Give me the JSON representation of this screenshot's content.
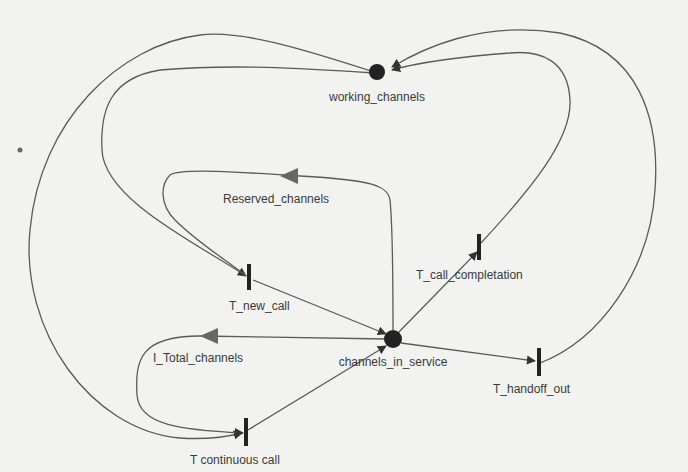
{
  "diagram": {
    "type": "petri-net",
    "colors": {
      "background": "#f2f2f0",
      "arc": "#5a5a5a",
      "place": "#222222",
      "transition": "#222222",
      "inhibitor_arrow": "#666666",
      "label": "#3a3a3a"
    },
    "places": [
      {
        "id": "working_channels",
        "label": "working_channels"
      },
      {
        "id": "channels_in_service",
        "label": "channels_in_service"
      }
    ],
    "transitions": [
      {
        "id": "T_new_call",
        "label": "T_new_call"
      },
      {
        "id": "T_call_completation",
        "label": "T_call_completation"
      },
      {
        "id": "T_handoff_out",
        "label": "T_handoff_out"
      },
      {
        "id": "T_continuous_call",
        "label": "T continuous call"
      }
    ],
    "guards": [
      {
        "id": "Reserved_channels",
        "label": "Reserved_channels"
      },
      {
        "id": "I_Total_channels",
        "label": "I_Total_channels"
      }
    ],
    "arcs": [
      {
        "from": "working_channels",
        "to": "T_new_call"
      },
      {
        "from": "working_channels",
        "to": "T_continuous_call"
      },
      {
        "from": "T_call_completation",
        "to": "working_channels"
      },
      {
        "from": "T_handoff_out",
        "to": "working_channels"
      },
      {
        "from": "T_new_call",
        "to": "channels_in_service"
      },
      {
        "from": "T_continuous_call",
        "to": "channels_in_service"
      },
      {
        "from": "channels_in_service",
        "to": "T_call_completation"
      },
      {
        "from": "channels_in_service",
        "to": "T_handoff_out"
      },
      {
        "from": "channels_in_service",
        "to": "Reserved_channels",
        "kind": "inhibitor-to-T_new_call"
      },
      {
        "from": "channels_in_service",
        "to": "I_Total_channels",
        "kind": "inhibitor-to-T_continuous_call"
      }
    ]
  }
}
